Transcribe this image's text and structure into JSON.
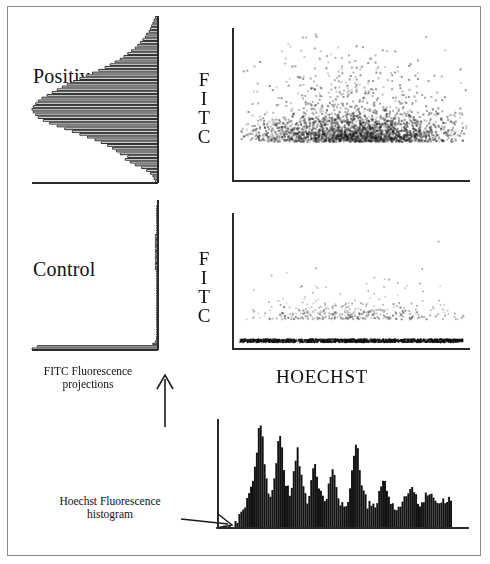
{
  "figure": {
    "title_visible": false,
    "background": "#ffffff",
    "border_color": "#8a8a8a",
    "ink_color": "#2a2a2a"
  },
  "labels": {
    "positive": "Positive",
    "control": "Control",
    "fitc_letters": [
      "F",
      "I",
      "T",
      "C"
    ],
    "hoechst": "HOECHST",
    "fitc_projection_caption_line1": "FITC Fluorescence",
    "fitc_projection_caption_line2": "projections",
    "hoechst_histogram_caption_line1": "Hoechst Fluorescence",
    "hoechst_histogram_caption_line2": "histogram"
  },
  "chart_data": [
    {
      "id": "positive-fitc-projection",
      "type": "bar",
      "orientation": "horizontal",
      "title": "Positive",
      "xlabel": "FITC Fluorescence projection (counts)",
      "ylabel": "FITC",
      "grid": false,
      "legend": "none",
      "note": "Histogram bars extend leftward from the vertical axis; broad positive FITC distribution peaking at mid-low channel.",
      "ylim": [
        0,
        60
      ],
      "xlim": [
        0,
        100
      ],
      "bins": [
        0,
        1,
        2,
        3,
        4,
        5,
        6,
        7,
        8,
        9,
        10,
        11,
        12,
        13,
        14,
        15,
        16,
        17,
        18,
        19,
        20,
        21,
        22,
        23,
        24,
        25,
        26,
        27,
        28,
        29,
        30,
        31,
        32,
        33,
        34,
        35,
        36,
        37,
        38,
        39,
        40,
        41,
        42,
        43,
        44,
        45,
        46,
        47,
        48,
        49,
        50,
        51,
        52,
        53,
        54,
        55,
        56,
        57,
        58,
        59
      ],
      "values": [
        2,
        3,
        4,
        6,
        9,
        13,
        18,
        22,
        26,
        24,
        30,
        33,
        36,
        40,
        45,
        50,
        56,
        62,
        68,
        74,
        80,
        86,
        91,
        95,
        97,
        99,
        100,
        99,
        97,
        95,
        92,
        88,
        84,
        80,
        76,
        72,
        67,
        62,
        57,
        52,
        47,
        42,
        38,
        34,
        30,
        27,
        24,
        21,
        18,
        16,
        14,
        12,
        10,
        9,
        7,
        6,
        5,
        4,
        3,
        2
      ]
    },
    {
      "id": "positive-scatter",
      "type": "scatter",
      "title": "Positive",
      "xlabel": "HOECHST",
      "ylabel": "FITC",
      "grid": false,
      "legend": "none",
      "point_count": 2600,
      "note": "Dense dark cloud of events spanning mid-to-high Hoechst, concentrated in lower-to-mid FITC with sparse high-FITC outliers.",
      "xlim": [
        0,
        100
      ],
      "ylim": [
        0,
        100
      ],
      "cluster": {
        "x_center": 52,
        "y_center": 26,
        "x_spread": 22,
        "y_spread": 16
      }
    },
    {
      "id": "control-fitc-projection",
      "type": "bar",
      "orientation": "horizontal",
      "title": "Control",
      "xlabel": "FITC Fluorescence projection (counts)",
      "ylabel": "FITC",
      "grid": false,
      "legend": "none",
      "note": "Nearly all events at the lowest FITC channel: one long bar at the baseline, negligible counts elsewhere.",
      "ylim": [
        0,
        60
      ],
      "xlim": [
        0,
        100
      ],
      "bins": [
        0,
        1,
        2,
        3,
        4,
        5,
        6,
        7,
        8,
        9,
        10,
        11,
        12,
        13,
        14,
        15,
        16,
        17,
        18,
        19,
        20,
        21,
        22,
        23,
        24,
        25,
        26,
        27,
        28,
        29,
        30,
        31,
        32,
        33,
        34,
        35,
        36,
        37,
        38,
        39,
        40,
        41,
        42,
        43,
        44,
        45,
        46,
        47,
        48,
        49,
        50,
        51,
        52,
        53,
        54,
        55,
        56,
        57,
        58,
        59
      ],
      "values": [
        96,
        92,
        4,
        2,
        1,
        1,
        1,
        1,
        1,
        1,
        1,
        1,
        1,
        1,
        1,
        1,
        1,
        1,
        1,
        1,
        1,
        1,
        1,
        1,
        1,
        1,
        1,
        1,
        1,
        1,
        1,
        1,
        1,
        2,
        2,
        2,
        2,
        2,
        2,
        2,
        2,
        2,
        2,
        2,
        2,
        2,
        2,
        2,
        1,
        1,
        1,
        1,
        1,
        1,
        1,
        1,
        1,
        1,
        1,
        1
      ]
    },
    {
      "id": "control-scatter",
      "type": "scatter",
      "title": "Control",
      "xlabel": "HOECHST",
      "ylabel": "FITC",
      "grid": false,
      "legend": "none",
      "point_count": 430,
      "note": "Sparse scattered events across Hoechst with a dense black band of negative events pressed against the FITC baseline.",
      "xlim": [
        0,
        100
      ],
      "ylim": [
        0,
        100
      ],
      "baseline_band": {
        "y": 6,
        "density": "high"
      },
      "cluster": {
        "x_center": 50,
        "y_center": 22,
        "x_spread": 26,
        "y_spread": 10
      }
    },
    {
      "id": "hoechst-histogram",
      "type": "bar",
      "orientation": "vertical",
      "title": "Hoechst Fluorescence histogram",
      "xlabel": "HOECHST",
      "ylabel": "Counts",
      "grid": false,
      "legend": "none",
      "note": "Multi-peaked DNA content profile: several tall sharp peaks at low Hoechst, a prominent mid peak, then a lower irregular tail.",
      "xlim": [
        0,
        120
      ],
      "ylim": [
        0,
        100
      ],
      "values": [
        0,
        0,
        0,
        0,
        0,
        0,
        0,
        0,
        2,
        6,
        10,
        14,
        18,
        22,
        26,
        30,
        34,
        40,
        52,
        70,
        88,
        97,
        82,
        60,
        44,
        36,
        30,
        34,
        44,
        62,
        80,
        86,
        72,
        54,
        40,
        34,
        30,
        36,
        48,
        66,
        72,
        60,
        44,
        34,
        28,
        26,
        30,
        40,
        52,
        58,
        50,
        38,
        30,
        26,
        24,
        28,
        36,
        48,
        56,
        50,
        40,
        30,
        24,
        20,
        18,
        20,
        26,
        36,
        50,
        66,
        76,
        70,
        56,
        42,
        32,
        26,
        22,
        20,
        18,
        18,
        20,
        24,
        30,
        36,
        42,
        40,
        34,
        28,
        24,
        22,
        20,
        18,
        18,
        20,
        22,
        26,
        30,
        34,
        36,
        34,
        30,
        26,
        24,
        22,
        22,
        24,
        28,
        32,
        34,
        32,
        28,
        26,
        24,
        22,
        22,
        22,
        24,
        26,
        24,
        20
      ]
    }
  ]
}
